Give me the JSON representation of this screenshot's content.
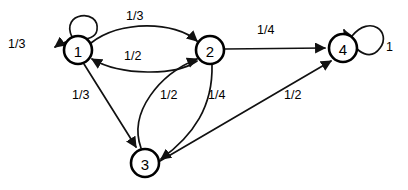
{
  "diagram": {
    "type": "directed-graph",
    "stroke_color": "#111111",
    "node_fill": "#ffffff",
    "node_stroke": "#000000",
    "nodes": [
      {
        "id": "1",
        "label": "1",
        "cx": 78,
        "cy": 50,
        "r": 14
      },
      {
        "id": "2",
        "label": "2",
        "cx": 210,
        "cy": 50,
        "r": 14
      },
      {
        "id": "4",
        "label": "4",
        "cx": 343,
        "cy": 48,
        "r": 14
      },
      {
        "id": "3",
        "label": "3",
        "cx": 145,
        "cy": 163,
        "r": 14
      }
    ],
    "edges": [
      {
        "from": "1",
        "to": "1",
        "label": "1/3",
        "kind": "self-loop",
        "label_x": 8,
        "label_y": 38
      },
      {
        "from": "1",
        "to": "2",
        "label": "1/3",
        "kind": "curve-up",
        "label_x": 126,
        "label_y": 10
      },
      {
        "from": "2",
        "to": "1",
        "label": "1/2",
        "kind": "curve-down",
        "label_x": 124,
        "label_y": 50
      },
      {
        "from": "2",
        "to": "4",
        "label": "1/4",
        "kind": "straight",
        "label_x": 257,
        "label_y": 24
      },
      {
        "from": "4",
        "to": "4",
        "label": "1",
        "kind": "self-loop",
        "label_x": 386,
        "label_y": 41
      },
      {
        "from": "1",
        "to": "3",
        "label": "1/3",
        "kind": "straight",
        "label_x": 72,
        "label_y": 89
      },
      {
        "from": "3",
        "to": "2",
        "label": "1/2",
        "kind": "curve-left",
        "label_x": 160,
        "label_y": 89
      },
      {
        "from": "2",
        "to": "3",
        "label": "1/4",
        "kind": "curve-right",
        "label_x": 208,
        "label_y": 89
      },
      {
        "from": "3",
        "to": "4",
        "label": "1/2",
        "kind": "straight",
        "label_x": 284,
        "label_y": 89
      }
    ]
  }
}
